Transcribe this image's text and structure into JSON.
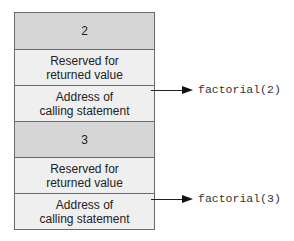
{
  "stack": {
    "frames": [
      {
        "parameter": "2",
        "reserved": "Reserved for\nreturned value",
        "address": "Address of\ncalling statement",
        "call_label": "factorial(2)"
      },
      {
        "parameter": "3",
        "reserved": "Reserved for\nreturned value",
        "address": "Address of\ncalling statement",
        "call_label": "factorial(3)"
      }
    ]
  },
  "colors": {
    "parameter_cell": "#d6d6d6",
    "info_cell": "#efefef",
    "border": "#6a6a6a"
  }
}
